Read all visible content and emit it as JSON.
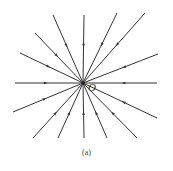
{
  "diagram": {
    "type": "field-lines-converging",
    "center": [
      83,
      83
    ],
    "center_label": "O",
    "caption": "(a)",
    "line_color": "#333333",
    "rays": [
      {
        "name": "up",
        "end": [
          84,
          15
        ]
      },
      {
        "name": "up-left-1",
        "end": [
          53,
          15
        ]
      },
      {
        "name": "up-left-2",
        "end": [
          35,
          33
        ]
      },
      {
        "name": "up-left-3",
        "end": [
          20,
          53
        ]
      },
      {
        "name": "left",
        "end": [
          15,
          83
        ]
      },
      {
        "name": "down-left-1",
        "end": [
          13,
          112
        ]
      },
      {
        "name": "down-left-2",
        "end": [
          33,
          138
        ]
      },
      {
        "name": "down-left-3",
        "end": [
          58,
          138
        ]
      },
      {
        "name": "down",
        "end": [
          84,
          138
        ]
      },
      {
        "name": "down-right-1",
        "end": [
          107,
          138
        ]
      },
      {
        "name": "down-right-2",
        "end": [
          137,
          138
        ]
      },
      {
        "name": "down-right-3",
        "end": [
          157,
          118
        ]
      },
      {
        "name": "right",
        "end": [
          157,
          83
        ]
      },
      {
        "name": "up-right-1",
        "end": [
          158,
          54
        ]
      },
      {
        "name": "up-right-2",
        "end": [
          145,
          13
        ]
      },
      {
        "name": "up-right-3",
        "end": [
          117,
          13
        ]
      }
    ],
    "arrow_direction": "inward"
  }
}
